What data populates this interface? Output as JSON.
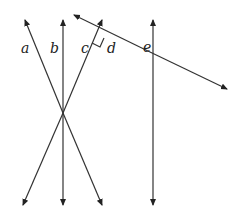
{
  "diagram": {
    "labels": {
      "a": "a",
      "b": "b",
      "c": "c",
      "d": "d",
      "e": "e"
    },
    "lines": [
      {
        "name": "a",
        "from": [
          25,
          20
        ],
        "to": [
          102,
          205
        ]
      },
      {
        "name": "b",
        "from": [
          63,
          20
        ],
        "to": [
          63,
          205
        ]
      },
      {
        "name": "c",
        "from": [
          102,
          20
        ],
        "to": [
          23,
          205
        ]
      },
      {
        "name": "e",
        "from": [
          153,
          20
        ],
        "to": [
          153,
          205
        ]
      },
      {
        "name": "d",
        "from": [
          74,
          15
        ],
        "to": [
          227,
          89
        ]
      }
    ],
    "right_angle_marker": "between c and d",
    "colors": {
      "stroke": "#333333",
      "background": "#ffffff"
    }
  }
}
